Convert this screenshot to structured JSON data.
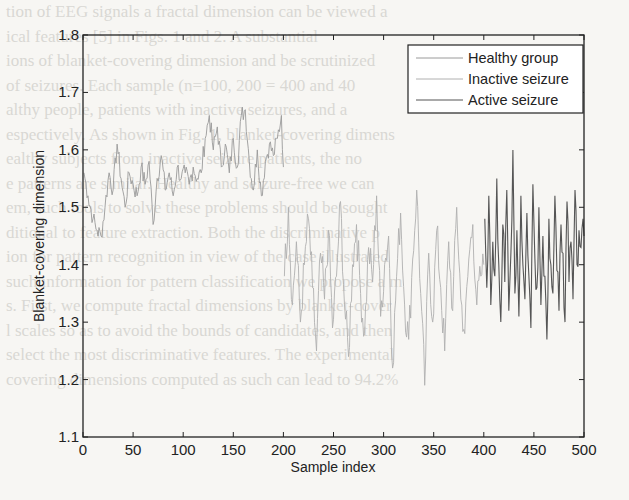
{
  "background_text": [
    "tion of EEG signals a fractal dimension can be viewed a",
    "ical features [5] in Figs. 1 and 2. A substantial",
    "ions of blanket-covering dimension and be scrutinized",
    "of seizures. Each sample (n=100, 200 = 400 and 40",
    "althy people, patients with inactive seizures, and a",
    "espectively. As shown in Fig. 1, blanket-covering dimens",
    "ealthy subjects from inactive seizure patients, the no",
    "e patterns are similar. Healthy and seizure-free we can",
    "em, such tools to solve these problems should be sought",
    "ditional to feature extraction. Both the discriminative p",
    "ion for pattern recognition in view of the case illustrated",
    "such information for pattern classification we propose a m",
    "s. First, we compute fractal dimensions by blanket-cover",
    "l scales so as to avoid the bounds of candidates, and then",
    "select the most discriminative features. The experimental",
    "covering dimensions computed as such can lead to 94.2%"
  ],
  "chart_data": {
    "type": "line",
    "title": "",
    "xlabel": "Sample index",
    "ylabel": "Blanket-covering dimension",
    "xlim": [
      0,
      500
    ],
    "ylim": [
      1.1,
      1.8
    ],
    "xticks": [
      0,
      50,
      100,
      150,
      200,
      250,
      300,
      350,
      400,
      450,
      500
    ],
    "yticks": [
      1.1,
      1.2,
      1.3,
      1.4,
      1.5,
      1.6,
      1.7,
      1.8
    ],
    "grid": false,
    "legend_position": "upper right",
    "series": [
      {
        "name": "Healthy group",
        "color": "#9a9a9a",
        "x_range": [
          1,
          200
        ],
        "x": [
          1,
          5,
          10,
          14,
          18,
          22,
          26,
          30,
          34,
          38,
          42,
          46,
          50,
          54,
          58,
          62,
          66,
          70,
          74,
          78,
          82,
          86,
          90,
          94,
          98,
          102,
          106,
          110,
          114,
          118,
          122,
          126,
          130,
          134,
          138,
          142,
          146,
          150,
          154,
          158,
          162,
          166,
          170,
          174,
          178,
          182,
          186,
          190,
          194,
          198,
          200
        ],
        "values": [
          1.56,
          1.52,
          1.48,
          1.46,
          1.45,
          1.5,
          1.56,
          1.53,
          1.61,
          1.55,
          1.5,
          1.56,
          1.54,
          1.52,
          1.57,
          1.54,
          1.58,
          1.47,
          1.55,
          1.59,
          1.53,
          1.56,
          1.52,
          1.57,
          1.55,
          1.56,
          1.54,
          1.57,
          1.55,
          1.56,
          1.62,
          1.66,
          1.6,
          1.64,
          1.57,
          1.61,
          1.56,
          1.62,
          1.57,
          1.66,
          1.67,
          1.58,
          1.53,
          1.6,
          1.52,
          1.58,
          1.61,
          1.59,
          1.62,
          1.66,
          1.57
        ]
      },
      {
        "name": "Inactive seizure",
        "color": "#b0b0b0",
        "x_range": [
          201,
          400
        ],
        "x": [
          201,
          205,
          209,
          213,
          217,
          221,
          225,
          229,
          233,
          237,
          241,
          245,
          249,
          253,
          257,
          261,
          265,
          269,
          273,
          277,
          281,
          285,
          289,
          293,
          297,
          301,
          305,
          309,
          313,
          317,
          321,
          325,
          329,
          333,
          337,
          341,
          345,
          349,
          353,
          357,
          361,
          365,
          369,
          373,
          377,
          381,
          385,
          389,
          393,
          397,
          400
        ],
        "values": [
          1.38,
          1.5,
          1.33,
          1.44,
          1.3,
          1.4,
          1.48,
          1.36,
          1.25,
          1.42,
          1.34,
          1.46,
          1.29,
          1.38,
          1.51,
          1.33,
          1.24,
          1.4,
          1.47,
          1.35,
          1.28,
          1.43,
          1.37,
          1.52,
          1.31,
          1.4,
          1.45,
          1.22,
          1.38,
          1.49,
          1.33,
          1.27,
          1.41,
          1.53,
          1.35,
          1.19,
          1.42,
          1.3,
          1.46,
          1.36,
          1.25,
          1.44,
          1.32,
          1.5,
          1.34,
          1.28,
          1.41,
          1.47,
          1.33,
          1.38,
          1.4
        ]
      },
      {
        "name": "Active seizure",
        "color": "#555555",
        "x_range": [
          401,
          500
        ],
        "x": [
          401,
          403,
          405,
          407,
          409,
          411,
          413,
          415,
          417,
          419,
          421,
          423,
          425,
          427,
          429,
          431,
          433,
          435,
          437,
          439,
          441,
          443,
          445,
          447,
          449,
          451,
          453,
          455,
          457,
          459,
          461,
          463,
          465,
          467,
          469,
          471,
          473,
          475,
          477,
          479,
          481,
          483,
          485,
          487,
          489,
          491,
          493,
          495,
          497,
          499,
          500
        ],
        "values": [
          1.48,
          1.36,
          1.52,
          1.33,
          1.44,
          1.38,
          1.55,
          1.4,
          1.3,
          1.47,
          1.37,
          1.53,
          1.32,
          1.42,
          1.6,
          1.35,
          1.46,
          1.31,
          1.52,
          1.4,
          1.34,
          1.49,
          1.38,
          1.29,
          1.54,
          1.41,
          1.36,
          1.5,
          1.33,
          1.45,
          1.38,
          1.27,
          1.48,
          1.4,
          1.35,
          1.52,
          1.39,
          1.32,
          1.47,
          1.42,
          1.3,
          1.51,
          1.37,
          1.44,
          1.34,
          1.53,
          1.4,
          1.46,
          1.43,
          1.48,
          1.45
        ]
      }
    ]
  },
  "legend": {
    "items": [
      {
        "label": "Healthy group",
        "color": "#9a9a9a"
      },
      {
        "label": "Inactive seizure",
        "color": "#b0b0b0"
      },
      {
        "label": "Active seizure",
        "color": "#555555"
      }
    ]
  },
  "axis_labels": {
    "x": "Sample index",
    "y": "Blanket-covering dimension"
  },
  "colors": {
    "axis": "#222222",
    "background": "#f7f6f3"
  }
}
